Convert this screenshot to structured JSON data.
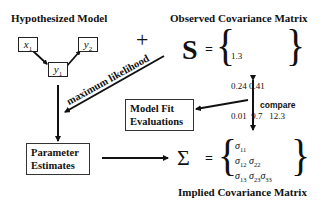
{
  "titles": {
    "hypothesized_model": "Hypothesized Model",
    "observed_matrix": "Observed Covariance Matrix",
    "implied_matrix": "Implied Covariance Matrix"
  },
  "model_nodes": [
    {
      "id": "x1",
      "base": "x",
      "sub": "1"
    },
    {
      "id": "y1",
      "base": "y",
      "sub": "1"
    },
    {
      "id": "y2",
      "base": "y",
      "sub": "2"
    }
  ],
  "model_edges": [
    {
      "from": "x1",
      "to": "y1"
    },
    {
      "from": "y1",
      "to": "y2"
    }
  ],
  "operators": {
    "plus": "+",
    "equals": "=",
    "observed_symbol": "S",
    "implied_symbol": "Σ",
    "open_brace": "{",
    "close_brace": "}"
  },
  "observed_matrix": {
    "rows": [
      [
        "1.3"
      ],
      [
        "0.24",
        "0.41"
      ],
      [
        "0.01",
        "9.7",
        "12.3"
      ]
    ]
  },
  "implied_matrix": {
    "rows": [
      [
        {
          "base": "σ",
          "sub": "11"
        }
      ],
      [
        {
          "base": "σ",
          "sub": "12"
        },
        {
          "base": "σ",
          "sub": "22"
        }
      ],
      [
        {
          "base": "σ",
          "sub": "13"
        },
        {
          "base": "σ",
          "sub": "23"
        },
        {
          "base": "σ",
          "sub": "33"
        }
      ]
    ]
  },
  "boxes": {
    "model_fit": {
      "line1": "Model Fit",
      "line2": "Evaluations"
    },
    "parameter_estimates": {
      "line1": "Parameter",
      "line2": "Estimates"
    }
  },
  "arrow_labels": {
    "maximum_likelihood": "maximum likelihood",
    "compare": "compare"
  },
  "colors": {
    "ink": "#111111",
    "background": "#ffffff"
  }
}
